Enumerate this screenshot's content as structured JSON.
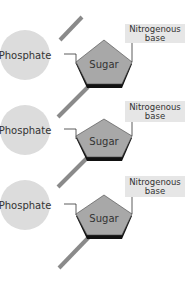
{
  "diagram": {
    "type": "nucleotide-chain",
    "colors": {
      "backbone": "#8a8a8a",
      "phosphate": "#dcdcdc",
      "sugar": "#a8a8a8",
      "sugar_shadow": "#111111",
      "base_box": "#e6e6e6",
      "connector": "#333333"
    },
    "nucleotides": [
      {
        "phosphate": "Phosphate",
        "sugar": "Sugar",
        "base_line1": "Nitrogenous",
        "base_line2": "base"
      },
      {
        "phosphate": "Phosphate",
        "sugar": "Sugar",
        "base_line1": "Nitrogenous",
        "base_line2": "base"
      },
      {
        "phosphate": "Phosphate",
        "sugar": "Sugar",
        "base_line1": "Nitrogenous",
        "base_line2": "base"
      }
    ]
  }
}
